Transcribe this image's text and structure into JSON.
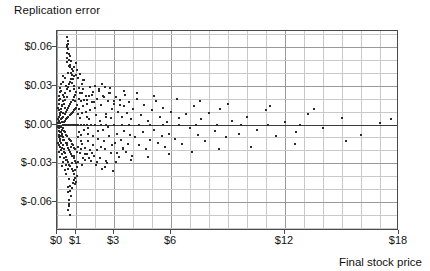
{
  "chart_data": {
    "type": "scatter",
    "title": "Replication error",
    "xlabel": "Final stock price",
    "ylabel": "Replication error",
    "grid": true,
    "legend": null,
    "xlim": [
      0,
      18
    ],
    "ylim": [
      -0.082,
      0.072
    ],
    "x_tick_labels": [
      "$0",
      "$1",
      "$3",
      "$6",
      "$12",
      "$18"
    ],
    "x_tick_values": [
      0,
      1,
      3,
      6,
      12,
      18
    ],
    "x_gridline_step": 1,
    "y_tick_labels": [
      "$0.06",
      "$0.03",
      "$0.00",
      "$-0.03",
      "$-0.06"
    ],
    "y_tick_values": [
      0.06,
      0.03,
      0.0,
      -0.03,
      -0.06
    ],
    "y_gridline_step": 0.01,
    "zero_line": 0.0,
    "marker": "square",
    "marker_color": "#2b2b2b",
    "marker_size_px": 2,
    "n_points": 404,
    "points": [
      [
        0.05,
        0.001
      ],
      [
        0.06,
        -0.002
      ],
      [
        0.07,
        0.004
      ],
      [
        0.08,
        -0.005
      ],
      [
        0.09,
        0.002
      ],
      [
        0.1,
        -0.001
      ],
      [
        0.1,
        0.006
      ],
      [
        0.11,
        -0.008
      ],
      [
        0.12,
        0.003
      ],
      [
        0.13,
        -0.003
      ],
      [
        0.14,
        0.009
      ],
      [
        0.15,
        -0.006
      ],
      [
        0.16,
        0.001
      ],
      [
        0.17,
        -0.011
      ],
      [
        0.18,
        0.007
      ],
      [
        0.19,
        -0.002
      ],
      [
        0.2,
        0.012
      ],
      [
        0.21,
        -0.009
      ],
      [
        0.22,
        0.004
      ],
      [
        0.23,
        -0.014
      ],
      [
        0.24,
        0.002
      ],
      [
        0.25,
        -0.004
      ],
      [
        0.26,
        0.015
      ],
      [
        0.27,
        -0.007
      ],
      [
        0.28,
        0.005
      ],
      [
        0.29,
        -0.016
      ],
      [
        0.3,
        0.009
      ],
      [
        0.31,
        -0.003
      ],
      [
        0.32,
        0.018
      ],
      [
        0.33,
        -0.01
      ],
      [
        0.34,
        0.006
      ],
      [
        0.35,
        -0.019
      ],
      [
        0.36,
        0.002
      ],
      [
        0.37,
        -0.005
      ],
      [
        0.38,
        0.021
      ],
      [
        0.39,
        -0.012
      ],
      [
        0.4,
        0.008
      ],
      [
        0.41,
        -0.022
      ],
      [
        0.42,
        0.003
      ],
      [
        0.43,
        -0.006
      ],
      [
        0.44,
        0.024
      ],
      [
        0.45,
        -0.014
      ],
      [
        0.46,
        0.01
      ],
      [
        0.47,
        -0.025
      ],
      [
        0.48,
        0.004
      ],
      [
        0.49,
        -0.008
      ],
      [
        0.5,
        0.027
      ],
      [
        0.51,
        -0.016
      ],
      [
        0.52,
        0.011
      ],
      [
        0.53,
        -0.027
      ],
      [
        0.54,
        0.005
      ],
      [
        0.55,
        -0.009
      ],
      [
        0.56,
        0.029
      ],
      [
        0.57,
        -0.018
      ],
      [
        0.58,
        0.013
      ],
      [
        0.59,
        -0.029
      ],
      [
        0.6,
        0.006
      ],
      [
        0.61,
        -0.011
      ],
      [
        0.62,
        0.031
      ],
      [
        0.63,
        -0.02
      ],
      [
        0.64,
        0.014
      ],
      [
        0.65,
        -0.031
      ],
      [
        0.66,
        0.007
      ],
      [
        0.67,
        -0.012
      ],
      [
        0.68,
        0.033
      ],
      [
        0.69,
        -0.021
      ],
      [
        0.7,
        0.016
      ],
      [
        0.71,
        -0.032
      ],
      [
        0.72,
        0.008
      ],
      [
        0.73,
        -0.013
      ],
      [
        0.74,
        0.035
      ],
      [
        0.75,
        -0.023
      ],
      [
        0.76,
        0.017
      ],
      [
        0.77,
        -0.034
      ],
      [
        0.78,
        0.009
      ],
      [
        0.79,
        -0.015
      ],
      [
        0.8,
        0.038
      ],
      [
        0.81,
        -0.024
      ],
      [
        0.82,
        0.019
      ],
      [
        0.83,
        -0.036
      ],
      [
        0.84,
        0.01
      ],
      [
        0.85,
        -0.016
      ],
      [
        0.86,
        0.041
      ],
      [
        0.87,
        -0.026
      ],
      [
        0.88,
        0.021
      ],
      [
        0.89,
        -0.038
      ],
      [
        0.9,
        0.011
      ],
      [
        0.91,
        -0.018
      ],
      [
        0.92,
        0.044
      ],
      [
        0.93,
        -0.028
      ],
      [
        0.94,
        0.023
      ],
      [
        0.95,
        -0.041
      ],
      [
        0.96,
        0.012
      ],
      [
        0.97,
        -0.019
      ],
      [
        0.98,
        0.047
      ],
      [
        0.99,
        -0.03
      ],
      [
        1.0,
        0.025
      ],
      [
        1.01,
        -0.044
      ],
      [
        1.02,
        0.013
      ],
      [
        1.03,
        -0.021
      ],
      [
        0.52,
        0.051
      ],
      [
        0.54,
        0.055
      ],
      [
        0.55,
        0.06
      ],
      [
        0.56,
        0.064
      ],
      [
        0.58,
        0.062
      ],
      [
        0.6,
        0.058
      ],
      [
        0.62,
        0.05
      ],
      [
        0.64,
        0.045
      ],
      [
        0.66,
        0.053
      ],
      [
        0.7,
        0.046
      ],
      [
        0.74,
        0.04
      ],
      [
        0.78,
        0.043
      ],
      [
        0.84,
        0.035
      ],
      [
        0.88,
        0.037
      ],
      [
        0.92,
        0.03
      ],
      [
        1.05,
        0.042
      ],
      [
        1.12,
        0.036
      ],
      [
        1.2,
        0.039
      ],
      [
        1.3,
        0.031
      ],
      [
        1.42,
        0.034
      ],
      [
        0.6,
        -0.052
      ],
      [
        0.62,
        -0.058
      ],
      [
        0.64,
        -0.063
      ],
      [
        0.66,
        -0.07
      ],
      [
        0.7,
        -0.047
      ],
      [
        0.74,
        -0.055
      ],
      [
        0.8,
        -0.049
      ],
      [
        0.88,
        -0.043
      ],
      [
        0.95,
        -0.046
      ],
      [
        1.05,
        -0.04
      ],
      [
        1.06,
        0.015
      ],
      [
        1.08,
        -0.01
      ],
      [
        1.1,
        0.008
      ],
      [
        1.12,
        -0.017
      ],
      [
        1.14,
        0.02
      ],
      [
        1.16,
        -0.006
      ],
      [
        1.18,
        0.012
      ],
      [
        1.2,
        -0.022
      ],
      [
        1.22,
        0.005
      ],
      [
        1.24,
        -0.013
      ],
      [
        1.26,
        0.018
      ],
      [
        1.28,
        -0.008
      ],
      [
        1.3,
        0.024
      ],
      [
        1.32,
        -0.015
      ],
      [
        1.34,
        0.009
      ],
      [
        1.36,
        -0.026
      ],
      [
        1.38,
        0.014
      ],
      [
        1.4,
        -0.004
      ],
      [
        1.44,
        0.019
      ],
      [
        1.48,
        -0.018
      ],
      [
        1.52,
        0.01
      ],
      [
        1.56,
        -0.023
      ],
      [
        1.6,
        0.016
      ],
      [
        1.64,
        -0.007
      ],
      [
        1.68,
        0.022
      ],
      [
        1.72,
        -0.02
      ],
      [
        1.76,
        0.011
      ],
      [
        1.8,
        -0.028
      ],
      [
        1.84,
        0.017
      ],
      [
        1.88,
        -0.009
      ],
      [
        1.92,
        0.025
      ],
      [
        1.96,
        -0.024
      ],
      [
        2.0,
        0.013
      ],
      [
        2.05,
        -0.031
      ],
      [
        2.1,
        0.02
      ],
      [
        2.15,
        -0.011
      ],
      [
        2.2,
        0.027
      ],
      [
        2.25,
        -0.026
      ],
      [
        2.3,
        0.015
      ],
      [
        2.35,
        -0.034
      ],
      [
        2.4,
        0.022
      ],
      [
        2.45,
        -0.013
      ],
      [
        2.5,
        0.029
      ],
      [
        2.55,
        -0.019
      ],
      [
        2.6,
        0.008
      ],
      [
        2.65,
        -0.03
      ],
      [
        2.7,
        0.018
      ],
      [
        2.75,
        -0.009
      ],
      [
        2.8,
        0.024
      ],
      [
        2.85,
        -0.022
      ],
      [
        2.9,
        0.012
      ],
      [
        2.95,
        -0.036
      ],
      [
        3.0,
        0.016
      ],
      [
        3.05,
        -0.014
      ],
      [
        3.1,
        0.021
      ],
      [
        3.15,
        -0.007
      ],
      [
        3.2,
        0.01
      ],
      [
        3.25,
        -0.025
      ],
      [
        3.3,
        0.019
      ],
      [
        3.35,
        -0.012
      ],
      [
        3.4,
        0.006
      ],
      [
        3.45,
        -0.018
      ],
      [
        3.5,
        0.014
      ],
      [
        3.55,
        -0.005
      ],
      [
        3.6,
        0.023
      ],
      [
        3.65,
        -0.021
      ],
      [
        3.7,
        0.009
      ],
      [
        3.75,
        -0.015
      ],
      [
        3.8,
        0.017
      ],
      [
        3.85,
        -0.008
      ],
      [
        3.9,
        0.004
      ],
      [
        3.95,
        -0.024
      ],
      [
        4.0,
        0.012
      ],
      [
        4.1,
        -0.01
      ],
      [
        4.2,
        0.02
      ],
      [
        4.3,
        -0.016
      ],
      [
        4.4,
        0.007
      ],
      [
        4.5,
        -0.006
      ],
      [
        4.6,
        0.015
      ],
      [
        4.7,
        -0.019
      ],
      [
        4.8,
        0.003
      ],
      [
        4.9,
        -0.012
      ],
      [
        5.0,
        0.011
      ],
      [
        5.1,
        -0.004
      ],
      [
        5.2,
        0.018
      ],
      [
        5.3,
        -0.014
      ],
      [
        5.4,
        0.006
      ],
      [
        5.5,
        -0.009
      ],
      [
        5.6,
        0.013
      ],
      [
        5.7,
        -0.017
      ],
      [
        5.8,
        0.002
      ],
      [
        5.9,
        -0.007
      ],
      [
        6.0,
        0.01
      ],
      [
        6.2,
        -0.011
      ],
      [
        6.4,
        0.005
      ],
      [
        6.6,
        -0.015
      ],
      [
        6.8,
        0.008
      ],
      [
        7.0,
        -0.003
      ],
      [
        7.2,
        0.014
      ],
      [
        7.4,
        -0.008
      ],
      [
        7.6,
        0.004
      ],
      [
        7.8,
        -0.013
      ],
      [
        8.0,
        0.009
      ],
      [
        8.3,
        -0.005
      ],
      [
        8.6,
        0.012
      ],
      [
        8.9,
        -0.01
      ],
      [
        9.2,
        0.003
      ],
      [
        9.6,
        -0.007
      ],
      [
        10.0,
        0.006
      ],
      [
        10.5,
        -0.004
      ],
      [
        11.0,
        0.011
      ],
      [
        11.5,
        -0.009
      ],
      [
        12.0,
        0.002
      ],
      [
        12.6,
        -0.006
      ],
      [
        13.2,
        0.008
      ],
      [
        14.0,
        -0.003
      ],
      [
        15.0,
        0.005
      ],
      [
        16.0,
        -0.008
      ],
      [
        17.0,
        0.001
      ],
      [
        17.6,
        0.004
      ],
      [
        2.35,
        0.031
      ],
      [
        2.8,
        0.028
      ],
      [
        3.5,
        0.026
      ],
      [
        4.2,
        0.024
      ],
      [
        5.1,
        0.022
      ],
      [
        6.3,
        0.02
      ],
      [
        7.5,
        0.018
      ],
      [
        9.0,
        0.016
      ],
      [
        11.2,
        0.014
      ],
      [
        13.5,
        0.012
      ],
      [
        2.5,
        -0.033
      ],
      [
        3.1,
        -0.029
      ],
      [
        3.9,
        -0.027
      ],
      [
        4.8,
        -0.025
      ],
      [
        5.9,
        -0.023
      ],
      [
        7.1,
        -0.021
      ],
      [
        8.5,
        -0.019
      ],
      [
        10.2,
        -0.017
      ],
      [
        12.5,
        -0.015
      ],
      [
        15.2,
        -0.013
      ],
      [
        0.3,
        0.0
      ],
      [
        0.35,
        0.0
      ],
      [
        0.4,
        0.0
      ],
      [
        0.45,
        0.0
      ],
      [
        0.5,
        0.0
      ],
      [
        0.55,
        0.0
      ],
      [
        0.6,
        0.0
      ],
      [
        0.65,
        0.0
      ],
      [
        0.7,
        0.0
      ],
      [
        0.75,
        0.0
      ],
      [
        0.8,
        0.0
      ],
      [
        0.85,
        0.0
      ],
      [
        0.9,
        0.0
      ],
      [
        0.95,
        0.0
      ],
      [
        1.0,
        0.0
      ],
      [
        1.1,
        0.0
      ],
      [
        1.25,
        0.0
      ],
      [
        1.4,
        0.0
      ],
      [
        1.6,
        0.0
      ],
      [
        1.8,
        0.0
      ],
      [
        2.0,
        0.0
      ],
      [
        2.3,
        0.0
      ],
      [
        2.6,
        0.0
      ],
      [
        3.0,
        0.0
      ],
      [
        3.4,
        0.0
      ],
      [
        3.8,
        0.0
      ],
      [
        4.3,
        0.0
      ],
      [
        4.9,
        0.0
      ],
      [
        5.6,
        0.0
      ],
      [
        6.4,
        0.0
      ],
      [
        7.3,
        0.0
      ],
      [
        8.4,
        0.0
      ],
      [
        9.7,
        0.0
      ],
      [
        11.1,
        0.0
      ],
      [
        12.8,
        0.0
      ],
      [
        0.15,
        0.02
      ],
      [
        0.18,
        -0.017
      ],
      [
        0.22,
        0.026
      ],
      [
        0.26,
        -0.023
      ],
      [
        0.3,
        0.033
      ],
      [
        0.34,
        -0.029
      ],
      [
        0.38,
        0.016
      ],
      [
        0.42,
        -0.035
      ],
      [
        0.46,
        0.03
      ],
      [
        0.5,
        -0.014
      ],
      [
        0.12,
        0.011
      ],
      [
        0.14,
        -0.013
      ],
      [
        0.16,
        0.008
      ],
      [
        0.2,
        -0.02
      ],
      [
        0.24,
        0.014
      ],
      [
        0.28,
        -0.009
      ],
      [
        0.32,
        0.023
      ],
      [
        0.36,
        -0.026
      ],
      [
        0.44,
        0.019
      ],
      [
        0.48,
        -0.031
      ],
      [
        0.08,
        0.016
      ],
      [
        0.09,
        -0.01
      ],
      [
        0.11,
        0.022
      ],
      [
        0.13,
        -0.016
      ],
      [
        0.17,
        0.028
      ],
      [
        0.19,
        -0.006
      ],
      [
        0.23,
        0.01
      ],
      [
        0.27,
        -0.032
      ],
      [
        0.33,
        0.037
      ],
      [
        0.37,
        -0.021
      ],
      [
        0.41,
        0.013
      ],
      [
        0.47,
        -0.027
      ],
      [
        0.53,
        0.021
      ],
      [
        0.59,
        -0.034
      ],
      [
        0.67,
        0.026
      ],
      [
        0.73,
        -0.017
      ],
      [
        0.81,
        0.032
      ],
      [
        0.89,
        -0.024
      ],
      [
        0.97,
        0.018
      ],
      [
        1.07,
        -0.033
      ],
      [
        1.15,
        0.028
      ],
      [
        1.25,
        -0.019
      ],
      [
        1.35,
        0.034
      ],
      [
        1.45,
        -0.027
      ],
      [
        1.55,
        0.022
      ],
      [
        1.65,
        -0.013
      ],
      [
        1.75,
        0.029
      ],
      [
        1.85,
        -0.022
      ],
      [
        1.95,
        0.017
      ],
      [
        2.08,
        -0.029
      ],
      [
        0.06,
        0.013
      ],
      [
        0.07,
        -0.014
      ],
      [
        0.1,
        0.019
      ],
      [
        0.12,
        -0.021
      ],
      [
        0.15,
        0.025
      ],
      [
        0.18,
        -0.025
      ],
      [
        0.21,
        0.031
      ],
      [
        0.25,
        -0.018
      ],
      [
        0.29,
        0.009
      ],
      [
        0.31,
        -0.012
      ],
      [
        0.43,
        0.036
      ],
      [
        0.49,
        -0.038
      ],
      [
        0.57,
        0.04
      ],
      [
        0.63,
        -0.042
      ],
      [
        0.71,
        0.044
      ],
      [
        0.79,
        -0.03
      ],
      [
        0.87,
        0.027
      ],
      [
        0.93,
        -0.035
      ],
      [
        1.01,
        0.038
      ],
      [
        1.09,
        -0.029
      ],
      [
        1.19,
        0.024
      ],
      [
        1.29,
        -0.031
      ],
      [
        1.39,
        0.027
      ],
      [
        1.49,
        -0.023
      ],
      [
        1.59,
        0.019
      ],
      [
        1.7,
        -0.026
      ],
      [
        1.82,
        0.023
      ],
      [
        1.9,
        -0.016
      ],
      [
        2.02,
        0.03
      ],
      [
        2.12,
        -0.02
      ],
      [
        2.22,
        0.026
      ],
      [
        2.32,
        -0.017
      ],
      [
        2.45,
        0.021
      ],
      [
        2.58,
        -0.028
      ],
      [
        2.72,
        0.024
      ],
      [
        2.88,
        -0.016
      ],
      [
        3.02,
        0.018
      ],
      [
        3.18,
        -0.022
      ],
      [
        3.32,
        0.015
      ],
      [
        3.48,
        -0.019
      ],
      [
        0.55,
        0.048
      ],
      [
        0.58,
        -0.048
      ],
      [
        0.61,
        0.054
      ],
      [
        0.68,
        -0.051
      ],
      [
        0.76,
        0.049
      ],
      [
        0.82,
        -0.045
      ],
      [
        0.5,
        0.067
      ],
      [
        0.53,
        0.061
      ],
      [
        0.57,
        -0.066
      ],
      [
        0.65,
        -0.061
      ],
      [
        1.58,
        0.006
      ],
      [
        1.62,
        -0.003
      ],
      [
        1.66,
        0.004
      ],
      [
        2.04,
        0.007
      ],
      [
        2.16,
        -0.005
      ],
      [
        2.28,
        0.003
      ],
      [
        2.42,
        -0.004
      ],
      [
        2.56,
        0.006
      ],
      [
        2.68,
        -0.002
      ],
      [
        2.82,
        0.005
      ]
    ]
  },
  "axes": {
    "x_min": 0,
    "x_max": 18,
    "y_min": -0.082,
    "y_max": 0.072
  }
}
